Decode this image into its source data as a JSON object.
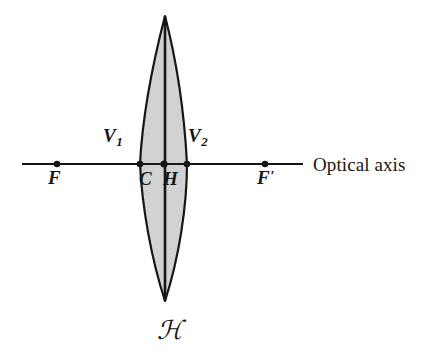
{
  "figure": {
    "background_color": "#ffffff",
    "stroke_color": "#161616",
    "lens_fill_color": "#d2d2d2",
    "width": 440,
    "height": 359
  },
  "optical_axis": {
    "label": "Optical axis",
    "x_start": 22,
    "x_end": 303,
    "y": 164
  },
  "lens": {
    "name": "biconvex-thick-lens",
    "top_apex": {
      "x": 165,
      "y": 16
    },
    "bottom_apex": {
      "x": 165,
      "y": 301
    },
    "left_edge_at_axis": 140,
    "right_edge_at_axis": 187,
    "principal_plane_label": "ℋ",
    "principal_plane_x": 165
  },
  "points": [
    {
      "id": "F",
      "label": "F",
      "prime": "",
      "subscript": "",
      "x": 57,
      "y": 164,
      "dot": true
    },
    {
      "id": "V1",
      "label": "V",
      "prime": "",
      "subscript": "1",
      "x": 140,
      "y": 164,
      "dot": true
    },
    {
      "id": "C",
      "label": "C",
      "prime": "",
      "subscript": "",
      "x": 164,
      "y": 164,
      "dot": true
    },
    {
      "id": "H",
      "label": "H",
      "prime": "",
      "subscript": "",
      "x": 171,
      "y": 164,
      "dot": false
    },
    {
      "id": "V2",
      "label": "V",
      "prime": "",
      "subscript": "2",
      "x": 187,
      "y": 164,
      "dot": true
    },
    {
      "id": "Fp",
      "label": "F",
      "prime": "′",
      "subscript": "",
      "x": 265,
      "y": 164,
      "dot": true
    }
  ],
  "labels": {
    "F": "F",
    "V1_letter": "V",
    "V1_sub": "1",
    "C": "C",
    "H": "H",
    "V2_letter": "V",
    "V2_sub": "2",
    "Fprime_letter": "F",
    "Fprime_mark": "′",
    "optical_axis": "Optical axis",
    "script_h": "ℋ"
  }
}
